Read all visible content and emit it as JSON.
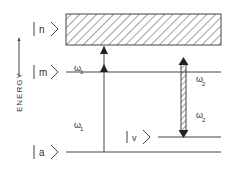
{
  "diagram": {
    "axis_label": "ENERGY",
    "levels": [
      {
        "id": "n",
        "label": "n",
        "y": 29,
        "type": "continuum-band"
      },
      {
        "id": "m",
        "label": "m",
        "y": 72,
        "type": "level"
      },
      {
        "id": "v",
        "label": "v",
        "y": 137,
        "type": "level"
      },
      {
        "id": "a",
        "label": "a",
        "y": 152,
        "type": "level"
      }
    ],
    "transitions": [
      {
        "from": "a",
        "to": "m",
        "label": "ω",
        "subscript": "1"
      },
      {
        "from": "m",
        "to": "n",
        "label": "ω",
        "subscript": "1"
      },
      {
        "from": "n",
        "to": "v",
        "label": "ω",
        "subscript": "2",
        "style": "hatched-double-arrow"
      }
    ],
    "omega_labels": {
      "upper_w1": {
        "sym": "ω",
        "sub": "1"
      },
      "lower_w1": {
        "sym": "ω",
        "sub": "1"
      },
      "upper_w2": {
        "sym": "ω",
        "sub": "2"
      },
      "lower_w2": {
        "sym": "ω",
        "sub": "2"
      }
    },
    "colors": {
      "ink": "#333333",
      "background": "#ffffff"
    }
  }
}
